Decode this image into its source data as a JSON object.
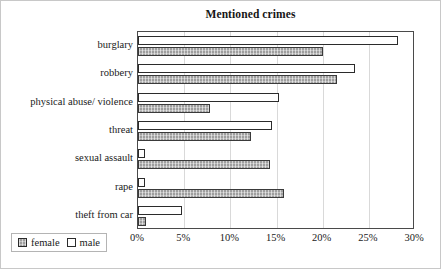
{
  "chart_data": {
    "type": "bar",
    "orientation": "horizontal",
    "title": "Mentioned crimes",
    "xlabel": "",
    "ylabel": "",
    "categories": [
      "burglary",
      "robbery",
      "physical abuse/ violence",
      "threat",
      "sexual assault",
      "rape",
      "theft from car"
    ],
    "series": [
      {
        "name": "female",
        "values": [
          20.0,
          21.5,
          7.8,
          12.2,
          14.3,
          15.8,
          0.9
        ]
      },
      {
        "name": "male",
        "values": [
          28.2,
          23.5,
          15.3,
          14.5,
          0.8,
          0.8,
          4.8
        ]
      }
    ],
    "xlim": [
      0,
      30
    ],
    "xticks": [
      0,
      5,
      10,
      15,
      20,
      25,
      30
    ],
    "xtick_labels": [
      "0%",
      "5%",
      "10%",
      "15%",
      "20%",
      "25%",
      "30%"
    ],
    "grid": "vertical",
    "legend_position": "bottom-left",
    "colors": {
      "female": "#9e9e9e",
      "male": "#ffffff",
      "bar_outline": "#2b2b2b",
      "axis": "#4a4a4a",
      "gridline": "#d9d9d9",
      "text": "#1a1a1a",
      "frame": "#c8c8c8"
    }
  },
  "legend": {
    "items": [
      {
        "label": "female",
        "swatch": "female"
      },
      {
        "label": "male",
        "swatch": "male"
      }
    ]
  }
}
